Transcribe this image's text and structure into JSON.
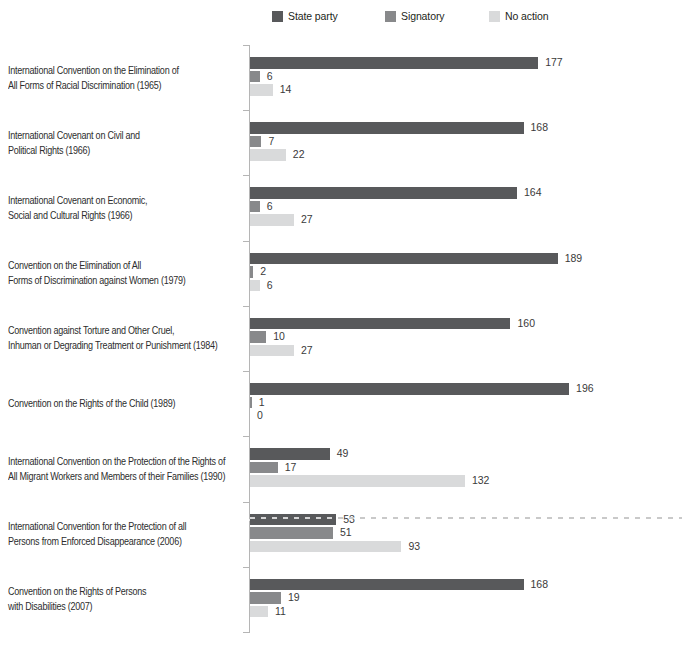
{
  "chart_data": {
    "type": "bar",
    "orientation": "horizontal",
    "title": "",
    "legend_position": "top",
    "grid": false,
    "value_labels": true,
    "xlim": [
      0,
      200
    ],
    "legend": [
      {
        "label": "State party",
        "color": "#58595b"
      },
      {
        "label": "Signatory",
        "color": "#88898b"
      },
      {
        "label": "No action",
        "color": "#d9dadb"
      }
    ],
    "rows": [
      {
        "label_lines": [
          "International Convention on the Elimination of",
          "All Forms of Racial Discrimination (1965)"
        ],
        "values": [
          177,
          6,
          14
        ]
      },
      {
        "label_lines": [
          "International Covenant on Civil and",
          "Political Rights (1966)"
        ],
        "values": [
          168,
          7,
          22
        ]
      },
      {
        "label_lines": [
          "International Covenant on Economic,",
          "Social and Cultural Rights (1966)"
        ],
        "values": [
          164,
          6,
          27
        ]
      },
      {
        "label_lines": [
          "Convention on the Elimination of All",
          "Forms of Discrimination against Women (1979)"
        ],
        "values": [
          189,
          2,
          6
        ]
      },
      {
        "label_lines": [
          "Convention against Torture and Other Cruel,",
          "Inhuman or Degrading Treatment or Punishment (1984)"
        ],
        "values": [
          160,
          10,
          27
        ]
      },
      {
        "label_lines": [
          "Convention on the Rights of the Child (1989)"
        ],
        "values": [
          196,
          1,
          0
        ]
      },
      {
        "label_lines": [
          "International Convention on the Protection of the Rights of",
          "All Migrant Workers and Members of their Families (1990)"
        ],
        "values": [
          49,
          17,
          132
        ]
      },
      {
        "label_lines": [
          "International Convention for the Protection of all",
          "Persons from Enforced Disappearance (2006)"
        ],
        "values": [
          53,
          51,
          93
        ]
      },
      {
        "label_lines": [
          "Convention on the Rights of Persons",
          "with Disabilities (2007)"
        ],
        "values": [
          168,
          19,
          11
        ]
      }
    ],
    "artifacts": [
      "horizontal dashed scan line crossing the Enforced Disappearance row; its State-party value label is partially obscured"
    ]
  }
}
